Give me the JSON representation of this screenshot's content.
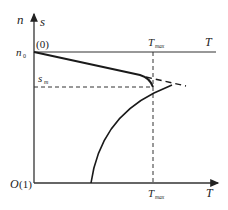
{
  "diagram": {
    "axis_labels": {
      "y_left": "n",
      "y_right": "s",
      "x": "T",
      "x_top": "T",
      "origin": "O",
      "origin_suffix": "(1)"
    },
    "markers": {
      "n0_main": "n",
      "n0_sub": "0",
      "top_point": "(0)",
      "sm_main": "s",
      "sm_sub": "m",
      "tmax_top_main": "T",
      "tmax_top_sub": "max",
      "tmax_bottom_main": "T",
      "tmax_bottom_sub": "max"
    },
    "colors": {
      "line": "#1a1a1a",
      "axis": "#333333",
      "text": "#222222"
    }
  }
}
